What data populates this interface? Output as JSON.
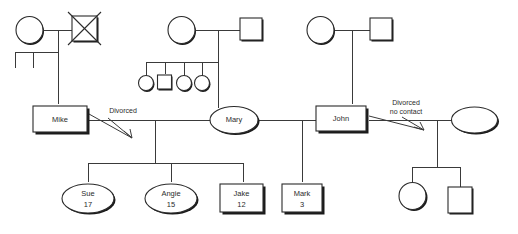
{
  "diagram": {
    "type": "genogram",
    "canvas": {
      "width": 518,
      "height": 234
    },
    "colors": {
      "line": "#3a3a3a",
      "shape_stroke": "#2b2b2b",
      "shape_fill": "#ffffff",
      "shadow": "#1a1a1a",
      "text": "#2b2b2b",
      "background": "#ffffff"
    }
  },
  "generation1": {
    "maternal_grandmother": {
      "symbol": "circle",
      "gender": "female",
      "label": ""
    },
    "maternal_grandfather": {
      "symbol": "square",
      "gender": "male",
      "label": "",
      "deceased": true
    },
    "marys_mother": {
      "symbol": "circle",
      "gender": "female",
      "label": ""
    },
    "marys_father": {
      "symbol": "square",
      "gender": "male",
      "label": ""
    },
    "johns_mother": {
      "symbol": "circle",
      "gender": "female",
      "label": ""
    },
    "johns_father": {
      "symbol": "square",
      "gender": "male",
      "label": ""
    }
  },
  "generation2": {
    "mike": {
      "symbol": "square",
      "gender": "male",
      "name": "Mike",
      "age": ""
    },
    "mary": {
      "symbol": "ellipse",
      "gender": "female",
      "name": "Mary",
      "age": ""
    },
    "john": {
      "symbol": "square",
      "gender": "male",
      "name": "John",
      "age": ""
    },
    "johns_new_partner": {
      "symbol": "ellipse",
      "gender": "female",
      "name": "",
      "age": ""
    },
    "mikes_siblings": [
      {
        "symbol": "stub",
        "label": ""
      },
      {
        "symbol": "stub",
        "label": ""
      }
    ],
    "marys_siblings": [
      {
        "symbol": "circle",
        "gender": "female",
        "label": ""
      },
      {
        "symbol": "square",
        "gender": "male",
        "label": ""
      },
      {
        "symbol": "circle",
        "gender": "female",
        "label": ""
      },
      {
        "symbol": "circle",
        "gender": "female",
        "label": ""
      }
    ]
  },
  "generation3": {
    "children_mike_mary": [
      {
        "symbol": "ellipse",
        "gender": "female",
        "name": "Sue",
        "age": "17"
      },
      {
        "symbol": "ellipse",
        "gender": "female",
        "name": "Angie",
        "age": "15"
      },
      {
        "symbol": "square",
        "gender": "male",
        "name": "Jake",
        "age": "12"
      }
    ],
    "children_mary_john": [
      {
        "symbol": "square",
        "gender": "male",
        "name": "Mark",
        "age": "3"
      }
    ],
    "children_john_partner": [
      {
        "symbol": "circle",
        "gender": "female",
        "name": "",
        "age": ""
      },
      {
        "symbol": "square",
        "gender": "male",
        "name": "",
        "age": ""
      }
    ]
  },
  "annotations": {
    "divorced_mike_mary": {
      "line1": "Divorced",
      "line2": ""
    },
    "divorced_john_partner": {
      "line1": "Divorced",
      "line2": "no contact"
    }
  }
}
